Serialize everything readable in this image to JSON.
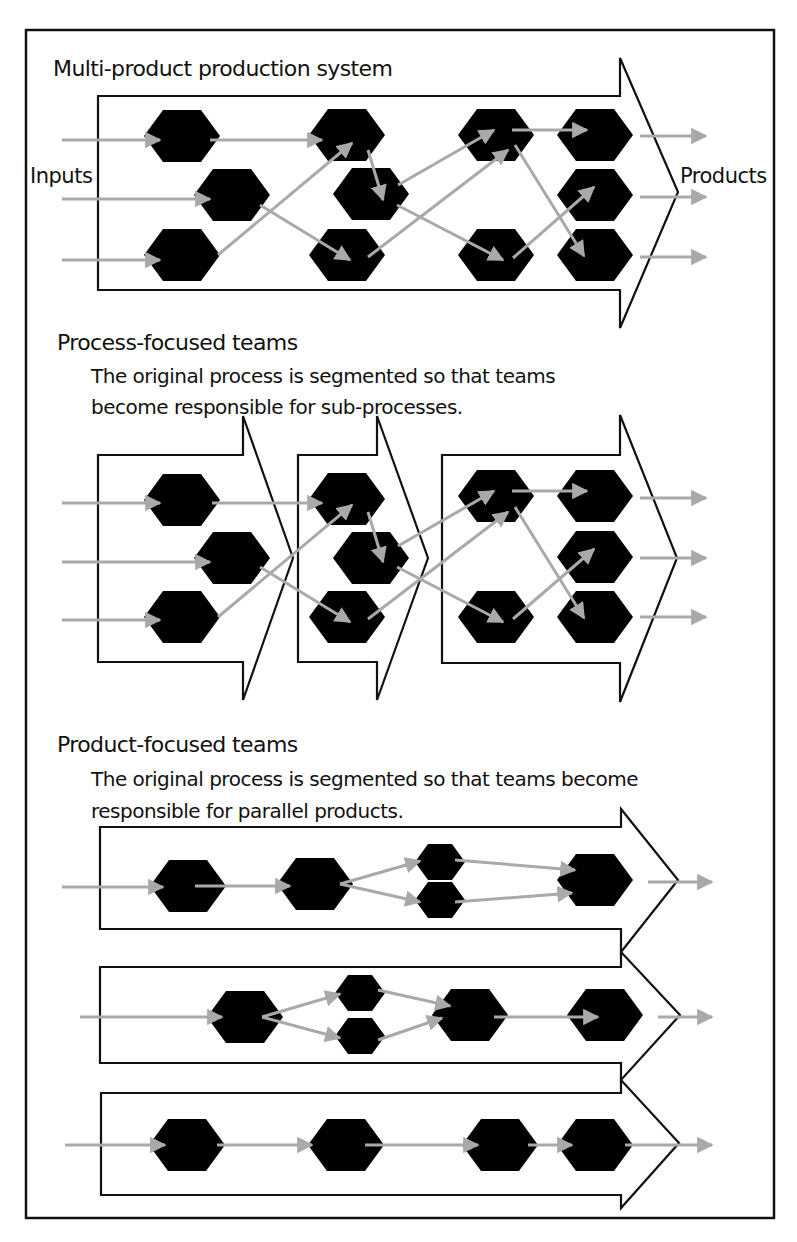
{
  "figure": {
    "colors": {
      "process_node": "#000000",
      "flow_arrow": "#a9a9a9",
      "outline": "#111111",
      "background": "#ffffff"
    },
    "node_icon": "hexagon",
    "flow_icon": "arrow-right"
  },
  "sections": [
    {
      "id": "multi-product",
      "title": "Multi-product production system",
      "description_lines": [],
      "input_label": "Inputs",
      "output_label": "Products",
      "stages": 1,
      "nodes_per_column": [
        3,
        3,
        2,
        3
      ],
      "inputs": 3,
      "outputs": 3
    },
    {
      "id": "process-focused",
      "title": "Process-focused teams",
      "description_lines": [
        "The original process is segmented so that teams",
        "become responsible for sub-processes."
      ],
      "stages": 3,
      "inputs": 3,
      "outputs": 3
    },
    {
      "id": "product-focused",
      "title": "Product-focused teams",
      "description_lines": [
        "The original process is segmented so that teams  become",
        "responsible for parallel products."
      ],
      "lanes": 3,
      "inputs": 3,
      "outputs": 3
    }
  ]
}
